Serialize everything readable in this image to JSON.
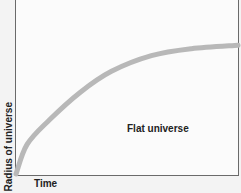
{
  "chart_data": {
    "type": "line",
    "title": "",
    "xlabel": "Time",
    "ylabel": "Radius of universe",
    "x_ticks": [],
    "y_ticks": [],
    "grid": false,
    "legend": null,
    "annotations": [
      {
        "text": "Flat universe",
        "x": 0.52,
        "y": 0.3
      }
    ],
    "xlim": [
      0,
      1
    ],
    "ylim": [
      0,
      1
    ],
    "series": [
      {
        "name": "Flat universe",
        "color": "#b8b8b8",
        "x": [
          0.0,
          0.05,
          0.15,
          0.29,
          0.43,
          0.61,
          0.79,
          1.0
        ],
        "y": [
          0.0,
          0.17,
          0.31,
          0.47,
          0.59,
          0.68,
          0.72,
          0.74
        ]
      }
    ]
  },
  "labels": {
    "ylabel": "Radius of universe",
    "xlabel": "Time",
    "annotation": "Flat universe"
  },
  "colors": {
    "curve": "#b8b8b8",
    "frame": "#6a6a6a",
    "background": "#f3f3f3",
    "plot_background": "#fbfbfb"
  }
}
